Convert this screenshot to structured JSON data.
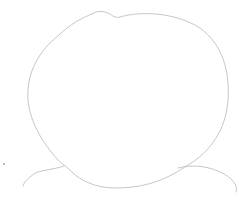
{
  "image": {
    "description": "Light pencil sketch of a round head outline with shoulder lines",
    "background": "#ffffff",
    "stroke_color": "#b8b8b8",
    "elements": [
      "head-outline",
      "left-shoulder-line",
      "right-shoulder-line",
      "stray-dot"
    ]
  }
}
